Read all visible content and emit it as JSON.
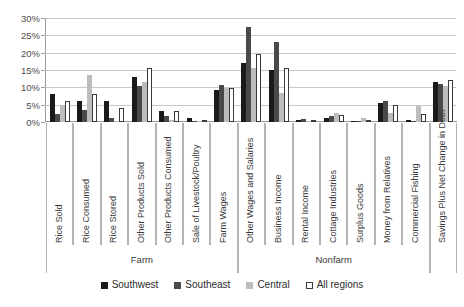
{
  "chart_data": {
    "type": "bar",
    "title": "",
    "subtitle": "",
    "xlabel": "",
    "ylabel": "",
    "ylim": [
      0,
      30
    ],
    "ytick_labels": [
      "0%",
      "5%",
      "10%",
      "15%",
      "20%",
      "25%",
      "30%"
    ],
    "ytick_values": [
      0,
      5,
      10,
      15,
      20,
      25,
      30
    ],
    "grid": true,
    "legend_position": "bottom",
    "value_unit": "%",
    "categories": [
      "Rice Sold",
      "Rice Consumed",
      "Rice Stored",
      "Other Products Sold",
      "Other Products Consumed",
      "Sale of Livestock/Poultry",
      "Farm Wages",
      "Other Wages and Salaries",
      "Business Income",
      "Rental Income",
      "Cottage Industries",
      "Surplus Goods",
      "Money from Relatives",
      "Commercial Fishing",
      "Savings Plus Net Change in Debt"
    ],
    "sections": [
      {
        "label": "Farm",
        "category_count": 7
      },
      {
        "label": "Nonfarm",
        "category_count": 7
      },
      {
        "label": "",
        "category_count": 1
      }
    ],
    "series": [
      {
        "name": "Southwest",
        "color": "#1a1a1a",
        "values": [
          8.0,
          6.2,
          6.2,
          13.0,
          3.3,
          1.2,
          9.3,
          17.0,
          15.0,
          0.7,
          1.3,
          0.4,
          5.5,
          0.5,
          11.5
        ]
      },
      {
        "name": "Southeast",
        "color": "#4a4a4a",
        "values": [
          2.3,
          3.6,
          1.3,
          10.5,
          1.6,
          0.3,
          10.6,
          27.5,
          23.0,
          0.8,
          1.6,
          0.3,
          6.0,
          0.4,
          11.0
        ]
      },
      {
        "name": "Central",
        "color": "#bdbdbd",
        "values": [
          4.8,
          13.5,
          0.4,
          11.5,
          0.5,
          0.1,
          9.9,
          15.5,
          8.5,
          0.3,
          2.6,
          1.2,
          2.5,
          4.6,
          10.5
        ]
      },
      {
        "name": "All regions",
        "color": "#ffffff",
        "values": [
          6.1,
          8.1,
          3.9,
          15.5,
          3.3,
          0.6,
          9.8,
          19.5,
          15.5,
          0.7,
          2.0,
          0.7,
          5.0,
          2.2,
          12.0
        ]
      }
    ]
  },
  "legend": {
    "items": [
      {
        "label": "Southwest"
      },
      {
        "label": "Southeast"
      },
      {
        "label": "Central"
      },
      {
        "label": "All regions"
      }
    ]
  }
}
